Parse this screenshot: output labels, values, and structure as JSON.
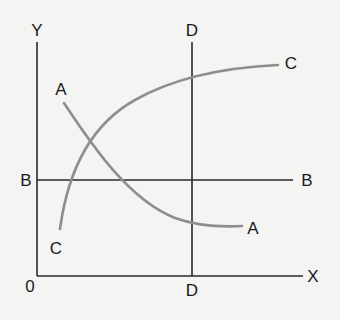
{
  "diagram": {
    "axes": {
      "y_label": "Y",
      "x_label": "X",
      "origin_label": "0"
    },
    "lines": {
      "vertical": {
        "label_top": "D",
        "label_bottom": "D"
      },
      "horizontal": {
        "label_left": "B",
        "label_right": "B"
      }
    },
    "curves": {
      "downward": {
        "label_start": "A",
        "label_end": "A"
      },
      "upward": {
        "label_start": "C",
        "label_end": "C"
      }
    },
    "colors": {
      "background": "#f4f4f2",
      "axis_lines": "#2a2a2a",
      "curves": "#8e8e8e"
    }
  }
}
